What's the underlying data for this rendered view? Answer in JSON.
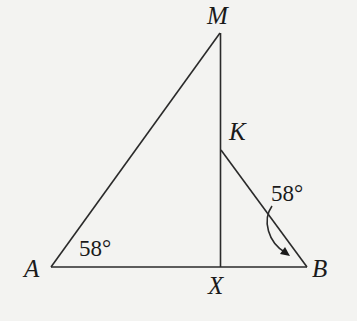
{
  "diagram": {
    "type": "geometry-figure",
    "points": {
      "M": {
        "label": "M"
      },
      "K": {
        "label": "K"
      },
      "A": {
        "label": "A"
      },
      "B": {
        "label": "B"
      },
      "X": {
        "label": "X"
      }
    },
    "segments": [
      "AM",
      "MX",
      "AB",
      "KB"
    ],
    "angles": {
      "at_A": {
        "vertex": "A",
        "label": "58°"
      },
      "at_B": {
        "vertex": "B",
        "between": [
          "KB",
          "AB"
        ],
        "label": "58°",
        "indicator": "curved-arrow"
      }
    },
    "colors": {
      "background": "#f3f3f1",
      "ink": "#1a1a1a"
    }
  }
}
